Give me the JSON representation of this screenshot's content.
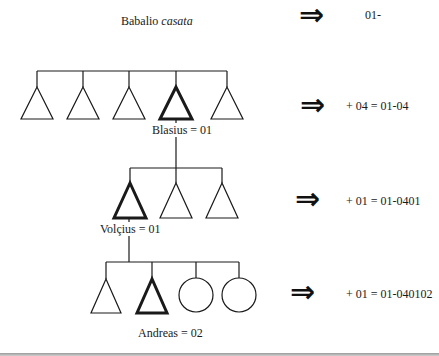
{
  "title": {
    "prefix": "Babalio ",
    "italic": "casata"
  },
  "levels": [
    {
      "name": "casata",
      "code_step": "01-",
      "members": [
        {
          "shape": "triangle",
          "highlight": false
        },
        {
          "shape": "triangle",
          "highlight": false
        },
        {
          "shape": "triangle",
          "highlight": false
        },
        {
          "shape": "triangle",
          "highlight": true
        },
        {
          "shape": "triangle",
          "highlight": false
        }
      ]
    },
    {
      "name": "Blasius",
      "label": "Blasius = 01",
      "code_step": "+ 04 = 01-04",
      "members": [
        {
          "shape": "triangle",
          "highlight": true
        },
        {
          "shape": "triangle",
          "highlight": false
        },
        {
          "shape": "triangle",
          "highlight": false
        }
      ]
    },
    {
      "name": "Volçius",
      "label": "Volçius = 01",
      "code_step": "+ 01 = 01-0401",
      "members": [
        {
          "shape": "triangle",
          "highlight": false
        },
        {
          "shape": "triangle",
          "highlight": true
        },
        {
          "shape": "circle",
          "highlight": false
        },
        {
          "shape": "circle",
          "highlight": false
        }
      ]
    },
    {
      "name": "Andreas",
      "label": "Andreas = 02",
      "code_step": "+ 01 = 01-040102"
    }
  ],
  "arrow_glyph": "⇒",
  "legend": {
    "triangle": "male",
    "circle": "female",
    "bold_outline": "ego lineage member"
  },
  "colors": {
    "line": "#1a1a1a",
    "background": "#ffffff"
  }
}
